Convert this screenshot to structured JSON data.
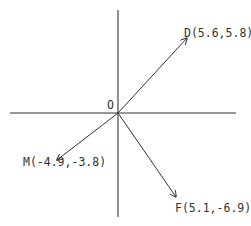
{
  "diagram": {
    "type": "vector-diagram",
    "origin_label": "O",
    "vectors": [
      {
        "name": "D",
        "label": "D(5.6,5.8)",
        "x": 5.6,
        "y": 5.8
      },
      {
        "name": "M",
        "label": "M(-4.9,-3.8)",
        "x": -4.9,
        "y": -3.8
      },
      {
        "name": "F",
        "label": "F(5.1,-6.9)",
        "x": 5.1,
        "y": -6.9
      }
    ],
    "colors": {
      "ink": "#333333",
      "background": "#ffffff"
    }
  }
}
